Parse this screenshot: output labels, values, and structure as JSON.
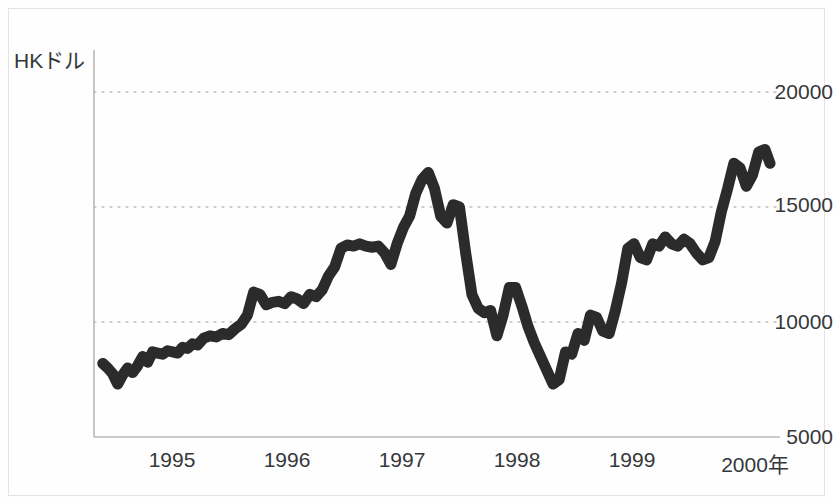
{
  "figure": {
    "width": 833,
    "height": 504,
    "background_color": "#fefefe",
    "line_color": "#2b2b2b",
    "grid_color": "#bfbfbf",
    "axis_color": "#b5b5b5",
    "text_color": "#35383a"
  },
  "chart_data": {
    "type": "line",
    "title": "",
    "subtitle": "",
    "xlabel": "年",
    "ylabel": "HKドル",
    "unit_label": "HKドル",
    "xlim": [
      1994.55,
      2000.05
    ],
    "ylim": [
      5000,
      20000
    ],
    "ytick_values": [
      5000,
      10000,
      15000,
      20000
    ],
    "ytick_labels": [
      "5000",
      "10000",
      "15000",
      "20000"
    ],
    "xtick_values": [
      1995,
      1996,
      1997,
      1998,
      1999,
      2000
    ],
    "xtick_labels": [
      "1995",
      "1996",
      "1997",
      "1998",
      "1999",
      "2000年"
    ],
    "grid": {
      "horizontal": true,
      "vertical": false,
      "style": "dotted"
    },
    "legend": {
      "visible": false,
      "position": "none"
    },
    "annotations": [],
    "series": [
      {
        "name": "香港ハンセン指数",
        "color": "#2b2b2b",
        "line_width": 11,
        "x": [
          1994.62,
          1994.66,
          1994.7,
          1994.74,
          1994.78,
          1994.82,
          1994.86,
          1994.9,
          1994.94,
          1994.98,
          1995.02,
          1995.06,
          1995.1,
          1995.14,
          1995.18,
          1995.22,
          1995.26,
          1995.3,
          1995.34,
          1995.38,
          1995.43,
          1995.48,
          1995.53,
          1995.58,
          1995.63,
          1995.68,
          1995.73,
          1995.78,
          1995.83,
          1995.88,
          1995.93,
          1995.98,
          1996.03,
          1996.08,
          1996.13,
          1996.18,
          1996.23,
          1996.28,
          1996.33,
          1996.38,
          1996.43,
          1996.48,
          1996.53,
          1996.58,
          1996.63,
          1996.68,
          1996.73,
          1996.78,
          1996.83,
          1996.88,
          1996.93,
          1996.98,
          1997.03,
          1997.08,
          1997.13,
          1997.18,
          1997.23,
          1997.28,
          1997.33,
          1997.38,
          1997.43,
          1997.48,
          1997.53,
          1997.58,
          1997.63,
          1997.68,
          1997.73,
          1997.78,
          1997.83,
          1997.88,
          1997.93,
          1997.98,
          1998.03,
          1998.08,
          1998.13,
          1998.18,
          1998.23,
          1998.28,
          1998.33,
          1998.38,
          1998.43,
          1998.48,
          1998.53,
          1998.58,
          1998.63,
          1998.68,
          1998.73,
          1998.78,
          1998.83,
          1998.88,
          1998.93,
          1998.98,
          1999.03,
          1999.08,
          1999.13,
          1999.18,
          1999.23,
          1999.28,
          1999.33,
          1999.38,
          1999.43,
          1999.48,
          1999.53,
          1999.58,
          1999.63,
          1999.68,
          1999.73,
          1999.78,
          1999.83,
          1999.88,
          1999.93,
          1999.97
        ],
        "y": [
          8200,
          8000,
          7750,
          7300,
          7700,
          8000,
          7800,
          8100,
          8500,
          8250,
          8700,
          8650,
          8600,
          8750,
          8700,
          8650,
          8900,
          8850,
          9050,
          9000,
          9300,
          9400,
          9350,
          9500,
          9450,
          9700,
          9900,
          10300,
          11300,
          11200,
          10750,
          10850,
          10900,
          10800,
          11100,
          11000,
          10800,
          11200,
          11100,
          11400,
          12000,
          12400,
          13200,
          13350,
          13300,
          13400,
          13300,
          13250,
          13300,
          13000,
          12500,
          13400,
          14100,
          14600,
          15600,
          16200,
          16500,
          15800,
          14600,
          14300,
          15100,
          15000,
          13000,
          11200,
          10600,
          10400,
          10500,
          9400,
          10300,
          11500,
          11500,
          10700,
          9800,
          9100,
          8500,
          7900,
          7300,
          7500,
          8700,
          8600,
          9500,
          9200,
          10300,
          10200,
          9600,
          9500,
          10500,
          11700,
          13200,
          13400,
          12800,
          12700,
          13400,
          13300,
          13700,
          13400,
          13300,
          13600,
          13400,
          13000,
          12700,
          12800,
          13500,
          14800,
          15800,
          16900,
          16700,
          15900,
          16400,
          17400,
          17500,
          16900
        ]
      }
    ]
  },
  "axes": {
    "plot_left_px": 94,
    "plot_right_px": 780,
    "plot_top_px": 92,
    "plot_bottom_px": 437
  }
}
